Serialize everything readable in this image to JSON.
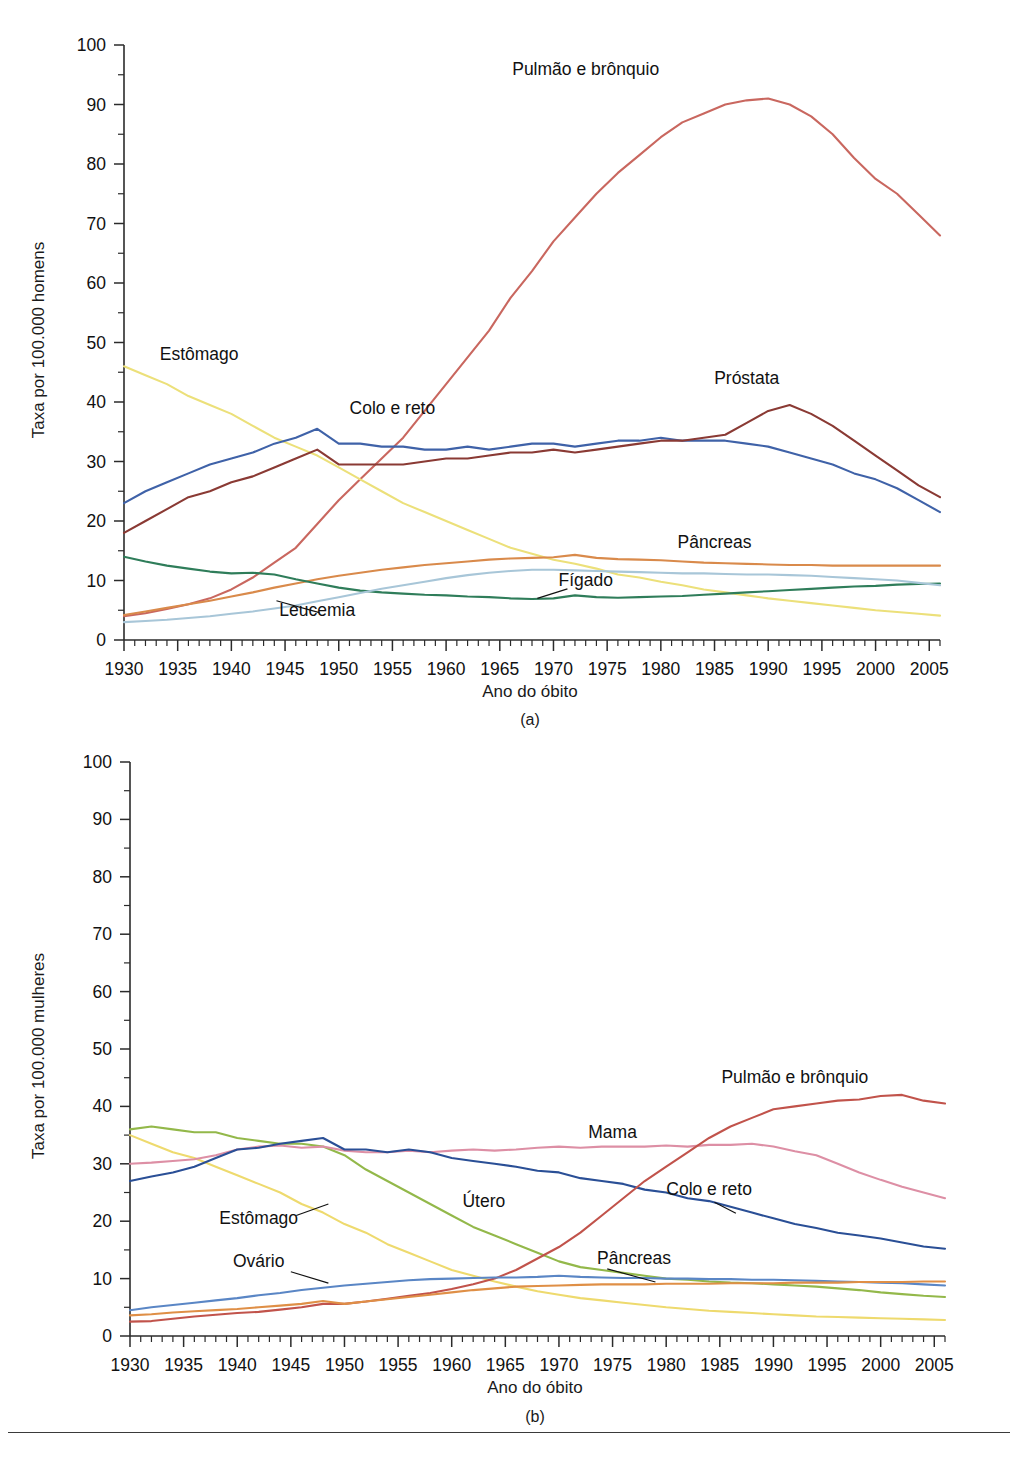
{
  "figure": {
    "background": "#ffffff",
    "panels": [
      {
        "id": "a",
        "caption": "(a)",
        "xlabel": "Ano do óbito",
        "ylabel": "Taxa por 100.000 homens"
      },
      {
        "id": "b",
        "caption": "(b)",
        "xlabel": "Ano do óbito",
        "ylabel": "Taxa por 100.000 mulheres"
      }
    ]
  },
  "chart_data": [
    {
      "type": "line",
      "panel": "a",
      "title": "",
      "xlabel": "Ano do óbito",
      "ylabel": "Taxa por 100.000 homens",
      "xlim": [
        1930,
        2006
      ],
      "ylim": [
        0,
        100
      ],
      "xticks": [
        1930,
        1935,
        1940,
        1945,
        1950,
        1955,
        1960,
        1965,
        1970,
        1975,
        1980,
        1985,
        1990,
        1995,
        2000,
        2005
      ],
      "yticks": [
        0,
        10,
        20,
        30,
        40,
        50,
        60,
        70,
        80,
        90,
        100
      ],
      "yminor_step": 5,
      "xminor_step": 1,
      "grid": false,
      "legend": "inline-annotations",
      "x": [
        1930,
        1932,
        1934,
        1936,
        1938,
        1940,
        1942,
        1944,
        1946,
        1948,
        1950,
        1952,
        1954,
        1956,
        1958,
        1960,
        1962,
        1964,
        1966,
        1968,
        1970,
        1972,
        1974,
        1976,
        1978,
        1980,
        1982,
        1984,
        1986,
        1988,
        1990,
        1992,
        1994,
        1996,
        1998,
        2000,
        2002,
        2004,
        2006
      ],
      "series": [
        {
          "name": "Pulmão e brônquio",
          "color": "#c9675f",
          "label_x": 1973,
          "label_y": 95,
          "values": [
            4.0,
            4.5,
            5.2,
            6.0,
            7.0,
            8.5,
            10.5,
            13.0,
            15.5,
            19.5,
            23.5,
            27.0,
            30.5,
            34.0,
            38.5,
            43.0,
            47.5,
            52.0,
            57.5,
            62.0,
            67.0,
            71.0,
            75.0,
            78.5,
            81.5,
            84.5,
            87.0,
            88.5,
            90.0,
            90.7,
            91.0,
            90.0,
            88.0,
            85.0,
            81.0,
            77.5,
            75.0,
            71.5,
            68.0
          ]
        },
        {
          "name": "Estômago",
          "color": "#ece07a",
          "label_x": 1937,
          "label_y": 47,
          "values": [
            46.0,
            44.5,
            43.0,
            41.0,
            39.5,
            38.0,
            36.0,
            34.0,
            32.5,
            31.0,
            29.0,
            27.0,
            25.0,
            23.0,
            21.5,
            20.0,
            18.5,
            17.0,
            15.5,
            14.5,
            13.5,
            12.8,
            12.0,
            11.0,
            10.5,
            9.8,
            9.2,
            8.5,
            8.0,
            7.5,
            7.0,
            6.6,
            6.2,
            5.8,
            5.4,
            5.0,
            4.7,
            4.4,
            4.1
          ]
        },
        {
          "name": "Colo e reto",
          "color": "#3f62a8",
          "label_x": 1955,
          "label_y": 38,
          "values": [
            23.0,
            25.0,
            26.5,
            28.0,
            29.5,
            30.5,
            31.5,
            33.0,
            34.0,
            35.5,
            33.0,
            33.0,
            32.5,
            32.5,
            32.0,
            32.0,
            32.5,
            32.0,
            32.5,
            33.0,
            33.0,
            32.5,
            33.0,
            33.5,
            33.5,
            34.0,
            33.5,
            33.5,
            33.5,
            33.0,
            32.5,
            31.5,
            30.5,
            29.5,
            28.0,
            27.0,
            25.5,
            23.5,
            21.5
          ]
        },
        {
          "name": "Próstata",
          "color": "#8a3a34",
          "label_x": 1988,
          "label_y": 43,
          "values": [
            18.0,
            20.0,
            22.0,
            24.0,
            25.0,
            26.5,
            27.5,
            29.0,
            30.5,
            32.0,
            29.5,
            29.5,
            29.5,
            29.5,
            30.0,
            30.5,
            30.5,
            31.0,
            31.5,
            31.5,
            32.0,
            31.5,
            32.0,
            32.5,
            33.0,
            33.5,
            33.5,
            34.0,
            34.5,
            36.5,
            38.5,
            39.5,
            38.0,
            36.0,
            33.5,
            31.0,
            28.5,
            26.0,
            24.0
          ]
        },
        {
          "name": "Pâncreas",
          "color": "#d98a4b",
          "label_x": 1985,
          "label_y": 15.5,
          "values": [
            4.2,
            4.8,
            5.4,
            6.0,
            6.6,
            7.3,
            8.0,
            8.8,
            9.5,
            10.2,
            10.8,
            11.3,
            11.8,
            12.2,
            12.6,
            12.9,
            13.2,
            13.5,
            13.7,
            13.8,
            13.9,
            14.3,
            13.8,
            13.6,
            13.5,
            13.4,
            13.2,
            13.0,
            12.9,
            12.8,
            12.7,
            12.6,
            12.6,
            12.5,
            12.5,
            12.5,
            12.5,
            12.5,
            12.5
          ]
        },
        {
          "name": "Fígado",
          "color": "#2f7d5a",
          "label_x": 1973,
          "label_y": 9.0,
          "values": [
            14.0,
            13.2,
            12.5,
            12.0,
            11.5,
            11.2,
            11.3,
            11.0,
            10.2,
            9.5,
            8.8,
            8.3,
            8.0,
            7.8,
            7.6,
            7.5,
            7.3,
            7.2,
            7.0,
            6.9,
            7.0,
            7.5,
            7.2,
            7.1,
            7.2,
            7.3,
            7.4,
            7.6,
            7.8,
            8.0,
            8.2,
            8.4,
            8.6,
            8.8,
            9.0,
            9.1,
            9.3,
            9.4,
            9.5
          ]
        },
        {
          "name": "Leucemia",
          "color": "#a8c6d8",
          "label_x": 1948,
          "label_y": 4.0,
          "values": [
            3.0,
            3.2,
            3.4,
            3.7,
            4.0,
            4.4,
            4.8,
            5.3,
            5.8,
            6.5,
            7.2,
            7.9,
            8.6,
            9.2,
            9.8,
            10.4,
            10.9,
            11.3,
            11.6,
            11.8,
            11.8,
            11.7,
            11.6,
            11.5,
            11.4,
            11.3,
            11.2,
            11.2,
            11.1,
            11.0,
            11.0,
            10.9,
            10.8,
            10.6,
            10.4,
            10.2,
            10.0,
            9.6,
            9.2
          ]
        }
      ]
    },
    {
      "type": "line",
      "panel": "b",
      "title": "",
      "xlabel": "Ano do óbito",
      "ylabel": "Taxa por 100.000 mulheres",
      "xlim": [
        1930,
        2006
      ],
      "ylim": [
        0,
        100
      ],
      "xticks": [
        1930,
        1935,
        1940,
        1945,
        1950,
        1955,
        1960,
        1965,
        1970,
        1975,
        1980,
        1985,
        1990,
        1995,
        2000,
        2005
      ],
      "yticks": [
        0,
        10,
        20,
        30,
        40,
        50,
        60,
        70,
        80,
        90,
        100
      ],
      "yminor_step": 5,
      "xminor_step": 1,
      "grid": false,
      "legend": "inline-annotations",
      "x": [
        1930,
        1932,
        1934,
        1936,
        1938,
        1940,
        1942,
        1944,
        1946,
        1948,
        1950,
        1952,
        1954,
        1956,
        1958,
        1960,
        1962,
        1964,
        1966,
        1968,
        1970,
        1972,
        1974,
        1976,
        1978,
        1980,
        1982,
        1984,
        1986,
        1988,
        1990,
        1992,
        1994,
        1996,
        1998,
        2000,
        2002,
        2004,
        2006
      ],
      "series": [
        {
          "name": "Útero",
          "color": "#93b84a",
          "label_x": 1963,
          "label_y": 22.5,
          "values": [
            36.0,
            36.5,
            36.0,
            35.5,
            35.5,
            34.5,
            34.0,
            33.5,
            33.5,
            33.0,
            31.5,
            29.0,
            27.0,
            25.0,
            23.0,
            21.0,
            19.0,
            17.5,
            16.0,
            14.5,
            13.0,
            12.0,
            11.5,
            11.0,
            10.5,
            10.0,
            9.8,
            9.5,
            9.3,
            9.2,
            9.0,
            8.8,
            8.6,
            8.3,
            8.0,
            7.6,
            7.3,
            7.0,
            6.8
          ]
        },
        {
          "name": "Estômago",
          "color": "#eeda6e",
          "label_x": 1942,
          "label_y": 19.5,
          "values": [
            35.0,
            33.5,
            32.0,
            31.0,
            29.5,
            28.0,
            26.5,
            25.0,
            23.0,
            21.5,
            19.5,
            18.0,
            16.0,
            14.5,
            13.0,
            11.5,
            10.5,
            9.5,
            8.6,
            7.8,
            7.2,
            6.6,
            6.2,
            5.8,
            5.4,
            5.0,
            4.7,
            4.4,
            4.2,
            4.0,
            3.8,
            3.6,
            3.4,
            3.3,
            3.2,
            3.1,
            3.0,
            2.9,
            2.8
          ]
        },
        {
          "name": "Mama",
          "color": "#dd8fa5",
          "label_x": 1975,
          "label_y": 34.5,
          "values": [
            30.0,
            30.2,
            30.5,
            30.8,
            31.5,
            32.5,
            33.0,
            33.2,
            32.8,
            33.0,
            32.3,
            32.0,
            32.0,
            32.3,
            32.0,
            32.3,
            32.5,
            32.3,
            32.5,
            32.8,
            33.0,
            32.8,
            33.0,
            33.0,
            33.0,
            33.2,
            33.0,
            33.3,
            33.3,
            33.5,
            33.0,
            32.2,
            31.5,
            30.0,
            28.5,
            27.2,
            26.0,
            25.0,
            24.0
          ]
        },
        {
          "name": "Colo e reto",
          "color": "#2a4f96",
          "label_x": 1984,
          "label_y": 24.5,
          "values": [
            27.0,
            27.8,
            28.5,
            29.5,
            31.0,
            32.5,
            32.8,
            33.5,
            34.0,
            34.5,
            32.5,
            32.5,
            32.0,
            32.5,
            32.0,
            31.0,
            30.5,
            30.0,
            29.5,
            28.8,
            28.5,
            27.5,
            27.0,
            26.5,
            25.5,
            25.0,
            24.0,
            23.5,
            22.5,
            21.5,
            20.5,
            19.5,
            18.8,
            18.0,
            17.5,
            17.0,
            16.3,
            15.6,
            15.2
          ]
        },
        {
          "name": "Pulmão e brônquio",
          "color": "#c1534b",
          "label_x": 1992,
          "label_y": 44,
          "values": [
            2.5,
            2.6,
            3.0,
            3.4,
            3.7,
            4.0,
            4.2,
            4.6,
            5.0,
            5.6,
            5.6,
            6.0,
            6.5,
            7.0,
            7.5,
            8.2,
            9.0,
            10.0,
            11.5,
            13.5,
            15.5,
            18.0,
            21.0,
            24.0,
            27.0,
            29.5,
            32.0,
            34.5,
            36.5,
            38.0,
            39.5,
            40.0,
            40.5,
            41.0,
            41.2,
            41.8,
            42.0,
            41.0,
            40.5
          ]
        },
        {
          "name": "Ovário",
          "color": "#5a86c5",
          "label_x": 1942,
          "label_y": 12,
          "values": [
            4.5,
            5.0,
            5.4,
            5.8,
            6.2,
            6.6,
            7.1,
            7.5,
            8.0,
            8.4,
            8.8,
            9.1,
            9.4,
            9.7,
            9.9,
            10.0,
            10.1,
            10.2,
            10.2,
            10.3,
            10.5,
            10.3,
            10.2,
            10.1,
            10.1,
            10.0,
            10.0,
            9.9,
            9.9,
            9.8,
            9.8,
            9.7,
            9.6,
            9.5,
            9.4,
            9.3,
            9.2,
            9.0,
            8.8
          ]
        },
        {
          "name": "Pâncreas",
          "color": "#df8f46",
          "label_x": 1977,
          "label_y": 12.6,
          "values": [
            3.6,
            3.8,
            4.1,
            4.3,
            4.5,
            4.7,
            5.0,
            5.3,
            5.6,
            6.1,
            5.6,
            6.0,
            6.4,
            6.8,
            7.2,
            7.6,
            8.0,
            8.3,
            8.6,
            8.7,
            8.8,
            8.9,
            9.0,
            9.0,
            9.0,
            9.1,
            9.1,
            9.1,
            9.2,
            9.2,
            9.2,
            9.3,
            9.3,
            9.3,
            9.4,
            9.4,
            9.4,
            9.5,
            9.5
          ]
        }
      ]
    }
  ]
}
